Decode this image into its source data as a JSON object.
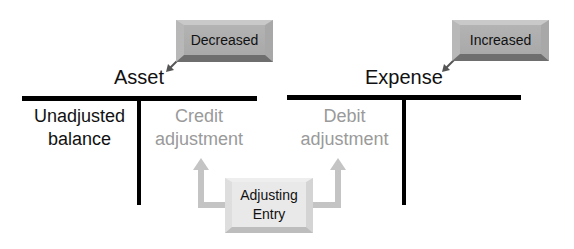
{
  "accounts": [
    {
      "title": "Asset",
      "callout": "Decreased",
      "left_label": [
        "Unadjusted",
        "balance"
      ],
      "right_label": [
        "Credit",
        "adjustment"
      ]
    },
    {
      "title": "Expense",
      "callout": "Increased",
      "left_label": [
        "Debit",
        "adjustment"
      ],
      "right_label": []
    }
  ],
  "adjusting_entry": [
    "Adjusting",
    "Entry"
  ],
  "colors": {
    "line": "#000000",
    "adjustment_text": "#9a9a9a",
    "callout_box": "#adadad",
    "entry_box": "#e9e9e9",
    "arrow": "#c4c4c4"
  }
}
